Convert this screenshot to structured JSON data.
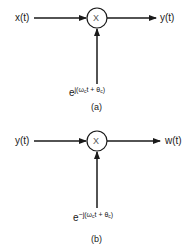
{
  "diagram": {
    "a": {
      "input_label": "x(t)",
      "operator_symbol": "X",
      "output_label": "y(t)",
      "carrier": {
        "base": "e",
        "exponent_prefix": "j(ω",
        "sub_c1": "c",
        "exponent_mid": "t + θ",
        "sub_c2": "c",
        "exponent_suffix": ")"
      },
      "caption": "(a)"
    },
    "b": {
      "input_label": "y(t)",
      "operator_symbol": "X",
      "output_label": "w(t)",
      "carrier": {
        "base": "e",
        "exponent_prefix": "−j(ω",
        "sub_c1": "c",
        "exponent_mid": "t + θ",
        "sub_c2": "c",
        "exponent_suffix": ")"
      },
      "caption": "(b)"
    },
    "colors": {
      "line": "#1a1a1a",
      "background": "#ffffff"
    }
  }
}
